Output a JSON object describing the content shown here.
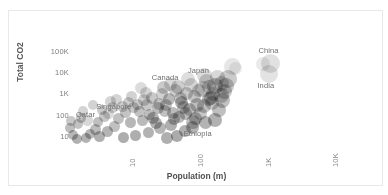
{
  "chart_data": {
    "type": "scatter",
    "title": "",
    "subtitle": "",
    "xlabel": "Population (m)",
    "ylabel": "Total CO2",
    "x_scale": "log",
    "y_scale": "log",
    "grid": false,
    "legend": "none",
    "xticks": [
      "10",
      "100",
      "1K",
      "10K"
    ],
    "xtick_values": [
      10,
      100,
      1000,
      10000
    ],
    "yticks": [
      "100K",
      "10K",
      "1K",
      "100",
      "10"
    ],
    "ytick_values": [
      100000,
      10000,
      1000,
      100,
      10
    ],
    "xlim": [
      1.2,
      40000
    ],
    "ylim": [
      3,
      400000
    ],
    "marker": "circle",
    "marker_opacity": 0.55,
    "annotations": [
      {
        "label": "Qatar",
        "x": 2.8,
        "y": 110
      },
      {
        "label": "Singapore",
        "x": 5.6,
        "y": 260
      },
      {
        "label": "Canada",
        "x": 37,
        "y": 5600
      },
      {
        "label": "Japan",
        "x": 127,
        "y": 12000
      },
      {
        "label": "China",
        "x": 1400,
        "y": 105000
      },
      {
        "label": "India",
        "x": 1350,
        "y": 2600
      },
      {
        "label": "Ethiopia",
        "x": 110,
        "y": 13
      }
    ],
    "points": [
      {
        "name": "China",
        "x": 1400,
        "y": 28000,
        "size": 19,
        "shade": "#c9c9c9"
      },
      {
        "name": "India",
        "x": 1350,
        "y": 9000,
        "size": 18,
        "shade": "#cccccc"
      },
      {
        "name": "Japan",
        "x": 380,
        "y": 21000,
        "size": 17,
        "shade": "#d2d2d2"
      },
      {
        "name": "USA",
        "x": 330,
        "y": 5200,
        "size": 18,
        "shade": "#a0a0a0"
      },
      {
        "name": "pt-004",
        "x": 210,
        "y": 2600,
        "size": 16,
        "shade": "#8e8e8e"
      },
      {
        "name": "pt-005",
        "x": 260,
        "y": 900,
        "size": 15,
        "shade": "#9a9a9a"
      },
      {
        "name": "pt-006",
        "x": 170,
        "y": 620,
        "size": 14,
        "shade": "#7f7f7f"
      },
      {
        "name": "pt-007",
        "x": 140,
        "y": 1700,
        "size": 16,
        "shade": "#b6b6b6"
      },
      {
        "name": "pt-008",
        "x": 115,
        "y": 330,
        "size": 14,
        "shade": "#8a8a8a"
      },
      {
        "name": "Ethiopia",
        "x": 100,
        "y": 52,
        "size": 14,
        "shade": "#8d8d8d"
      },
      {
        "name": "pt-010",
        "x": 80,
        "y": 1100,
        "size": 13,
        "shade": "#9d9d9d"
      },
      {
        "name": "pt-011",
        "x": 68,
        "y": 420,
        "size": 13,
        "shade": "#777777"
      },
      {
        "name": "pt-012",
        "x": 60,
        "y": 2300,
        "size": 14,
        "shade": "#a6a6a6"
      },
      {
        "name": "Canada",
        "x": 37,
        "y": 2000,
        "size": 13,
        "shade": "#9f9f9f"
      },
      {
        "name": "pt-014",
        "x": 44,
        "y": 600,
        "size": 12,
        "shade": "#808080"
      },
      {
        "name": "pt-015",
        "x": 30,
        "y": 230,
        "size": 12,
        "shade": "#878787"
      },
      {
        "name": "pt-016",
        "x": 26,
        "y": 80,
        "size": 12,
        "shade": "#747474"
      },
      {
        "name": "pt-017",
        "x": 19,
        "y": 520,
        "size": 12,
        "shade": "#a9a9a9"
      },
      {
        "name": "pt-018",
        "x": 16,
        "y": 150,
        "size": 11,
        "shade": "#8f8f8f"
      },
      {
        "name": "pt-019",
        "x": 12,
        "y": 45,
        "size": 11,
        "shade": "#7b7b7b"
      },
      {
        "name": "Singapore",
        "x": 5.6,
        "y": 130,
        "size": 11,
        "shade": "#bdbdbd"
      },
      {
        "name": "Qatar",
        "x": 2.8,
        "y": 60,
        "size": 11,
        "shade": "#b8b8b8"
      },
      {
        "name": "pt-022",
        "x": 9,
        "y": 260,
        "size": 11,
        "shade": "#a2a2a2"
      },
      {
        "name": "pt-023",
        "x": 7,
        "y": 30,
        "size": 11,
        "shade": "#8b8b8b"
      },
      {
        "name": "pt-024",
        "x": 5,
        "y": 95,
        "size": 11,
        "shade": "#979797"
      },
      {
        "name": "pt-025",
        "x": 3.6,
        "y": 22,
        "size": 11,
        "shade": "#858585"
      },
      {
        "name": "pt-026",
        "x": 2.4,
        "y": 170,
        "size": 10,
        "shade": "#b0b0b0"
      },
      {
        "name": "pt-027",
        "x": 2.0,
        "y": 40,
        "size": 10,
        "shade": "#909090"
      },
      {
        "name": "pt-028",
        "x": 1.7,
        "y": 12,
        "size": 10,
        "shade": "#7e7e7e"
      },
      {
        "name": "pt-029",
        "x": 4.2,
        "y": 10,
        "size": 11,
        "shade": "#6f6f6f"
      },
      {
        "name": "pt-030",
        "x": 14,
        "y": 11,
        "size": 11,
        "shade": "#6b6b6b"
      },
      {
        "name": "pt-031",
        "x": 22,
        "y": 16,
        "size": 11,
        "shade": "#757575"
      },
      {
        "name": "pt-032",
        "x": 33,
        "y": 26,
        "size": 12,
        "shade": "#7a7a7a"
      },
      {
        "name": "pt-033",
        "x": 48,
        "y": 38,
        "size": 12,
        "shade": "#6d6d6d"
      },
      {
        "name": "pt-034",
        "x": 62,
        "y": 90,
        "size": 12,
        "shade": "#828282"
      },
      {
        "name": "pt-035",
        "x": 90,
        "y": 200,
        "size": 13,
        "shade": "#8c8c8c"
      },
      {
        "name": "pt-036",
        "x": 130,
        "y": 120,
        "size": 13,
        "shade": "#999999"
      },
      {
        "name": "pt-037",
        "x": 190,
        "y": 380,
        "size": 14,
        "shade": "#a4a4a4"
      },
      {
        "name": "pt-038",
        "x": 240,
        "y": 180,
        "size": 14,
        "shade": "#8a8a8a"
      },
      {
        "name": "pt-039",
        "x": 290,
        "y": 1400,
        "size": 15,
        "shade": "#9c9c9c"
      },
      {
        "name": "pt-040",
        "x": 160,
        "y": 4200,
        "size": 15,
        "shade": "#aeaeae"
      },
      {
        "name": "pt-041",
        "x": 95,
        "y": 2800,
        "size": 14,
        "shade": "#b4b4b4"
      },
      {
        "name": "pt-042",
        "x": 55,
        "y": 1500,
        "size": 13,
        "shade": "#a7a7a7"
      },
      {
        "name": "pt-043",
        "x": 40,
        "y": 330,
        "size": 12,
        "shade": "#8e8e8e"
      },
      {
        "name": "pt-044",
        "x": 25,
        "y": 700,
        "size": 12,
        "shade": "#9b9b9b"
      },
      {
        "name": "pt-045",
        "x": 17,
        "y": 1900,
        "size": 12,
        "shade": "#c0c0c0"
      },
      {
        "name": "pt-046",
        "x": 11,
        "y": 430,
        "size": 11,
        "shade": "#a5a5a5"
      },
      {
        "name": "pt-047",
        "x": 8,
        "y": 75,
        "size": 11,
        "shade": "#8d8d8d"
      },
      {
        "name": "pt-048",
        "x": 6,
        "y": 480,
        "size": 11,
        "shade": "#b2b2b2"
      },
      {
        "name": "pt-049",
        "x": 4.5,
        "y": 190,
        "size": 10,
        "shade": "#a0a0a0"
      },
      {
        "name": "pt-050",
        "x": 3.0,
        "y": 13,
        "size": 10,
        "shade": "#7c7c7c"
      },
      {
        "name": "pt-051",
        "x": 2.2,
        "y": 75,
        "size": 10,
        "shade": "#949494"
      },
      {
        "name": "pt-052",
        "x": 1.5,
        "y": 26,
        "size": 10,
        "shade": "#888888"
      },
      {
        "name": "pt-053",
        "x": 1.9,
        "y": 8,
        "size": 10,
        "shade": "#707070"
      },
      {
        "name": "pt-054",
        "x": 5.5,
        "y": 17,
        "size": 11,
        "shade": "#767676"
      },
      {
        "name": "pt-055",
        "x": 9.5,
        "y": 9,
        "size": 11,
        "shade": "#6a6a6a"
      },
      {
        "name": "pt-056",
        "x": 18,
        "y": 60,
        "size": 11,
        "shade": "#818181"
      },
      {
        "name": "pt-057",
        "x": 28,
        "y": 45,
        "size": 12,
        "shade": "#737373"
      },
      {
        "name": "pt-058",
        "x": 50,
        "y": 140,
        "size": 12,
        "shade": "#838383"
      },
      {
        "name": "pt-059",
        "x": 72,
        "y": 250,
        "size": 13,
        "shade": "#8f8f8f"
      },
      {
        "name": "pt-060",
        "x": 105,
        "y": 800,
        "size": 13,
        "shade": "#969696"
      },
      {
        "name": "pt-061",
        "x": 145,
        "y": 280,
        "size": 14,
        "shade": "#909090"
      },
      {
        "name": "pt-062",
        "x": 200,
        "y": 1000,
        "size": 14,
        "shade": "#a1a1a1"
      },
      {
        "name": "pt-063",
        "x": 260,
        "y": 3400,
        "size": 15,
        "shade": "#ababab"
      },
      {
        "name": "pt-064",
        "x": 150,
        "y": 8000,
        "size": 15,
        "shade": "#bfbfbf"
      },
      {
        "name": "pt-065",
        "x": 85,
        "y": 5000,
        "size": 14,
        "shade": "#c3c3c3"
      },
      {
        "name": "pt-066",
        "x": 46,
        "y": 3000,
        "size": 13,
        "shade": "#bababa"
      },
      {
        "name": "pt-067",
        "x": 13,
        "y": 230,
        "size": 11,
        "shade": "#9e9e9e"
      },
      {
        "name": "pt-068",
        "x": 20,
        "y": 1100,
        "size": 12,
        "shade": "#b5b5b5"
      },
      {
        "name": "pt-069",
        "x": 35,
        "y": 1000,
        "size": 12,
        "shade": "#ababab"
      },
      {
        "name": "pt-070",
        "x": 65,
        "y": 650,
        "size": 13,
        "shade": "#9a9a9a"
      },
      {
        "name": "pt-071",
        "x": 120,
        "y": 1500,
        "size": 13,
        "shade": "#a3a3a3"
      },
      {
        "name": "pt-072",
        "x": 175,
        "y": 2200,
        "size": 14,
        "shade": "#a8a8a8"
      },
      {
        "name": "pt-073",
        "x": 230,
        "y": 6000,
        "size": 15,
        "shade": "#b7b7b7"
      },
      {
        "name": "pt-074",
        "x": 310,
        "y": 2400,
        "size": 16,
        "shade": "#9e9e9e"
      },
      {
        "name": "pt-075",
        "x": 97,
        "y": 28,
        "size": 13,
        "shade": "#787878"
      },
      {
        "name": "pt-076",
        "x": 75,
        "y": 18,
        "size": 12,
        "shade": "#6e6e6e"
      },
      {
        "name": "pt-077",
        "x": 58,
        "y": 11,
        "size": 12,
        "shade": "#666666"
      },
      {
        "name": "pt-078",
        "x": 41,
        "y": 9,
        "size": 12,
        "shade": "#6c6c6c"
      },
      {
        "name": "pt-079",
        "x": 31,
        "y": 350,
        "size": 12,
        "shade": "#959595"
      },
      {
        "name": "pt-080",
        "x": 23,
        "y": 110,
        "size": 11,
        "shade": "#898989"
      },
      {
        "name": "pt-081",
        "x": 15,
        "y": 330,
        "size": 11,
        "shade": "#9f9f9f"
      },
      {
        "name": "pt-082",
        "x": 10,
        "y": 140,
        "size": 11,
        "shade": "#929292"
      },
      {
        "name": "pt-083",
        "x": 6.5,
        "y": 250,
        "size": 11,
        "shade": "#a6a6a6"
      },
      {
        "name": "pt-084",
        "x": 4.0,
        "y": 48,
        "size": 10,
        "shade": "#8a8a8a"
      },
      {
        "name": "pt-085",
        "x": 2.6,
        "y": 9,
        "size": 10,
        "shade": "#737373"
      },
      {
        "name": "pt-086",
        "x": 1.6,
        "y": 55,
        "size": 10,
        "shade": "#9b9b9b"
      },
      {
        "name": "pt-087",
        "x": 3.3,
        "y": 300,
        "size": 10,
        "shade": "#afafaf"
      },
      {
        "name": "pt-088",
        "x": 7.5,
        "y": 600,
        "size": 11,
        "shade": "#b3b3b3"
      },
      {
        "name": "pt-089",
        "x": 12.5,
        "y": 800,
        "size": 11,
        "shade": "#acacac"
      },
      {
        "name": "pt-090",
        "x": 21,
        "y": 300,
        "size": 12,
        "shade": "#999999"
      },
      {
        "name": "pt-091",
        "x": 38,
        "y": 160,
        "size": 12,
        "shade": "#8b8b8b"
      },
      {
        "name": "pt-092",
        "x": 53,
        "y": 70,
        "size": 12,
        "shade": "#7f7f7f"
      },
      {
        "name": "pt-093",
        "x": 78,
        "y": 120,
        "size": 13,
        "shade": "#868686"
      },
      {
        "name": "pt-094",
        "x": 110,
        "y": 70,
        "size": 13,
        "shade": "#7d7d7d"
      },
      {
        "name": "pt-095",
        "x": 155,
        "y": 45,
        "size": 13,
        "shade": "#757575"
      },
      {
        "name": "pt-096",
        "x": 215,
        "y": 60,
        "size": 14,
        "shade": "#717171"
      },
      {
        "name": "pt-097",
        "x": 185,
        "y": 700,
        "size": 14,
        "shade": "#979797"
      },
      {
        "name": "pt-098",
        "x": 275,
        "y": 500,
        "size": 15,
        "shade": "#8d8d8d"
      },
      {
        "name": "pt-099",
        "x": 1100,
        "y": 27000,
        "size": 14,
        "shade": "#d8d8d8"
      },
      {
        "name": "pt-100",
        "x": 420,
        "y": 17000,
        "size": 13,
        "shade": "#dcdcdc"
      }
    ]
  }
}
